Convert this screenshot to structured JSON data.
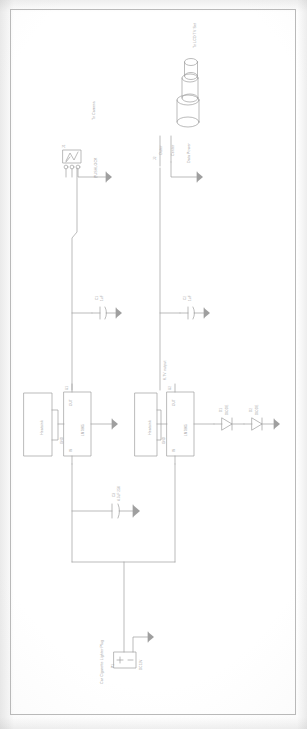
{
  "document": {
    "type": "circuit-schematic-scan",
    "orientation": "landscape-drawing-rotated-90-in-portrait-page",
    "title": "Car Power Supply / TV Tuner Schematic"
  },
  "colors": {
    "ink": "#8b8b8b",
    "paper": "#ffffff",
    "frame": "#b9b9b9"
  },
  "labels": {
    "to_lcd_tv_set": "To LCD TV Set",
    "to_camera": "To Camera",
    "pushlock": "PUSHLOCK",
    "outer": "Outer",
    "center": "Center",
    "data_power": "Data Power",
    "output_6v7": "6.7V output",
    "car_cigarette_lighter_plug": "Car Cigarette Lighter Plug"
  },
  "components": {
    "connector_j1": {
      "ref": "J1",
      "name": "pushlock-connector",
      "pin_count": 3,
      "label": "PUSHLOCK"
    },
    "connector_j2": {
      "ref": "J2",
      "name": "coax-antenna-connector",
      "pins": [
        "Outer",
        "Center"
      ],
      "note": "Data Power"
    },
    "regulator_u1": {
      "ref": "U1",
      "part": "LM7805",
      "pin_in": "IN",
      "pin_out": "OUT",
      "pin_gnd": "GND",
      "pin_numbers": [
        "1",
        "3",
        "2"
      ]
    },
    "regulator_u2": {
      "ref": "U2",
      "part": "LM7805",
      "pin_in": "IN",
      "pin_out": "OUT",
      "pin_gnd": "GND",
      "pin_numbers": [
        "1",
        "3",
        "2"
      ]
    },
    "heatsink_1": {
      "label": "Heatsink"
    },
    "heatsink_2": {
      "label": "Heatsink"
    },
    "cap_c1": {
      "ref": "C1",
      "value": "1uF"
    },
    "cap_c2": {
      "ref": "C2",
      "value": "1uF"
    },
    "cap_c3": {
      "ref": "C3",
      "value": "4.7uF 25V"
    },
    "diode_d1": {
      "ref": "D1",
      "part": "DIODE"
    },
    "diode_d2": {
      "ref": "D2",
      "part": "DIODE"
    },
    "source_plug": {
      "ref": "P1",
      "value": "DC12V",
      "label": "Car Cigarette Lighter Plug"
    }
  }
}
